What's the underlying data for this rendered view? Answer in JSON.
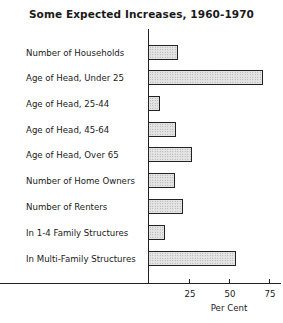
{
  "chart_data": {
    "type": "bar",
    "orientation": "horizontal",
    "title": "Some Expected Increases, 1960-1970",
    "xlabel": "Per Cent",
    "ylabel": "",
    "xlim": [
      0,
      82
    ],
    "xticks": [
      25,
      50,
      75
    ],
    "grid": false,
    "legend": null,
    "categories": [
      "Number of Households",
      "Age of Head, Under 25",
      "Age of Head, 25-44",
      "Age of Head, 45-64",
      "Age of Head, Over 65",
      "Number of Home Owners",
      "Number of Renters",
      "In 1-4 Family Structures",
      "In Multi-Family Structures"
    ],
    "values": [
      18,
      71,
      7,
      17,
      27,
      16,
      21,
      10,
      54
    ]
  },
  "tick_labels": [
    "25",
    "50",
    "75"
  ]
}
